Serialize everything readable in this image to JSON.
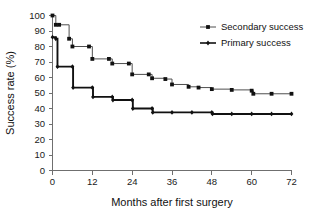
{
  "chart_data": {
    "type": "line",
    "subtype": "kaplan-meier-step",
    "title": "",
    "xlabel": "Months after first surgery",
    "ylabel": "Success rate (%)",
    "xlim": [
      0,
      72
    ],
    "ylim": [
      0,
      100
    ],
    "xticks": [
      0,
      12,
      24,
      36,
      48,
      60,
      72
    ],
    "yticks": [
      0,
      10,
      20,
      30,
      40,
      50,
      60,
      70,
      80,
      90,
      100
    ],
    "xtick_labels": [
      "0",
      "12",
      "24",
      "36",
      "48",
      "60",
      "72"
    ],
    "ytick_labels": [
      "0",
      "10",
      "20",
      "30",
      "40",
      "50",
      "60",
      "70",
      "80",
      "90",
      "100"
    ],
    "grid": false,
    "legend_position": "top-right",
    "series": [
      {
        "name": "Secondary success",
        "marker": "square",
        "stroke": "#4f4f4f",
        "points": [
          {
            "x": 0,
            "y": 100
          },
          {
            "x": 1,
            "y": 94
          },
          {
            "x": 2,
            "y": 94
          },
          {
            "x": 5,
            "y": 85
          },
          {
            "x": 6,
            "y": 80
          },
          {
            "x": 11,
            "y": 80
          },
          {
            "x": 12,
            "y": 72
          },
          {
            "x": 17,
            "y": 72
          },
          {
            "x": 18,
            "y": 69
          },
          {
            "x": 23,
            "y": 69
          },
          {
            "x": 24,
            "y": 62
          },
          {
            "x": 29,
            "y": 62
          },
          {
            "x": 30,
            "y": 59.5
          },
          {
            "x": 34,
            "y": 59
          },
          {
            "x": 36,
            "y": 55.5
          },
          {
            "x": 41,
            "y": 54
          },
          {
            "x": 44,
            "y": 53.5
          },
          {
            "x": 48,
            "y": 52.5
          },
          {
            "x": 54,
            "y": 52
          },
          {
            "x": 60,
            "y": 51.5
          },
          {
            "x": 60.5,
            "y": 49.5
          },
          {
            "x": 66,
            "y": 49.5
          },
          {
            "x": 72,
            "y": 49.5
          }
        ]
      },
      {
        "name": "Primary success",
        "marker": "diamond",
        "stroke": "#111111",
        "points": [
          {
            "x": 0,
            "y": 86
          },
          {
            "x": 1,
            "y": 85
          },
          {
            "x": 1.5,
            "y": 67
          },
          {
            "x": 6,
            "y": 67
          },
          {
            "x": 6.2,
            "y": 53.5
          },
          {
            "x": 12,
            "y": 53.5
          },
          {
            "x": 12.2,
            "y": 47.5
          },
          {
            "x": 18,
            "y": 47.5
          },
          {
            "x": 18.2,
            "y": 45.5
          },
          {
            "x": 24,
            "y": 45.5
          },
          {
            "x": 24.2,
            "y": 40
          },
          {
            "x": 30,
            "y": 40
          },
          {
            "x": 30.2,
            "y": 37.5
          },
          {
            "x": 36,
            "y": 37.5
          },
          {
            "x": 42,
            "y": 37.5
          },
          {
            "x": 48,
            "y": 37.5
          },
          {
            "x": 48.2,
            "y": 36.5
          },
          {
            "x": 54,
            "y": 36.5
          },
          {
            "x": 60,
            "y": 36.5
          },
          {
            "x": 66,
            "y": 36.5
          },
          {
            "x": 72,
            "y": 36.5
          }
        ]
      }
    ],
    "legend": [
      {
        "label": "Secondary success",
        "marker": "square"
      },
      {
        "label": "Primary success",
        "marker": "diamond"
      }
    ]
  }
}
